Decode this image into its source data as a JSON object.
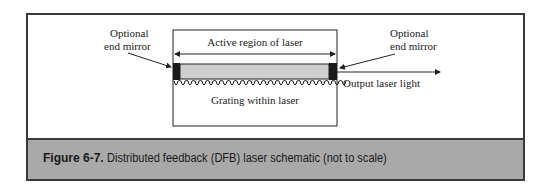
{
  "figure": {
    "label": "Figure 6-7.",
    "caption": "Distributed feedback (DFB) laser schematic (not to scale)"
  },
  "diagram": {
    "left_mirror_label": [
      "Optional",
      "end mirror"
    ],
    "right_mirror_label": [
      "Optional",
      "end mirror"
    ],
    "active_region_label": "Active region of laser",
    "grating_label": "Grating within laser",
    "output_label": "Output laser light"
  },
  "colors": {
    "frame_border": "#3a3a3a",
    "caption_band": "#a9a9a9",
    "active_region_fill": "#cfcfcf",
    "mirror_fill": "#1a1a1a"
  }
}
